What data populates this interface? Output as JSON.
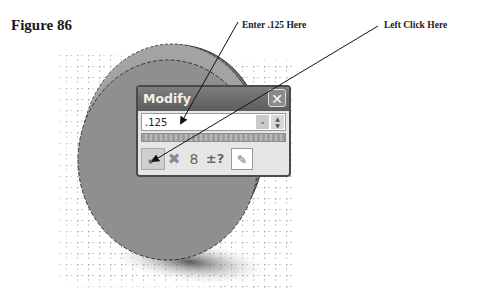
{
  "figure": {
    "title": "Figure 86"
  },
  "callouts": [
    {
      "text": "Enter .125 Here"
    },
    {
      "text": "Left Click Here"
    }
  ],
  "dialog": {
    "title": "Modify",
    "close_icon": "✕",
    "value": ".125",
    "dropdown_icon": "⌄",
    "spin_up": "▲",
    "spin_down": "▼",
    "buttons": [
      {
        "name": "ok",
        "icon": "✔"
      },
      {
        "name": "cancel",
        "icon": "✖"
      },
      {
        "name": "rebuild",
        "icon": "8"
      },
      {
        "name": "tolerance",
        "icon": "±?"
      },
      {
        "name": "mark-for-drawing",
        "icon": "✎"
      }
    ]
  },
  "colors": {
    "part": "#8f8f8f",
    "part_edge": "#555555",
    "dialog_title": "#666666"
  }
}
